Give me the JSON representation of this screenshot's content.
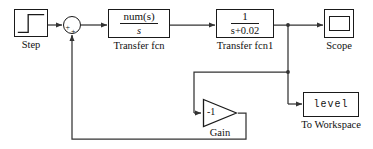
{
  "diagram": {
    "background_color": "#ffffff",
    "line_color": "#333333"
  },
  "blocks": {
    "step": {
      "label": "Step",
      "icon": "step-waveform-icon",
      "type": "source"
    },
    "sum": {
      "label": "",
      "icon": "summing-junction-icon",
      "type": "sum",
      "input_sign": "+",
      "feedback_sign": "+"
    },
    "transfer_fcn": {
      "label": "Transfer fcn",
      "numerator": "num(s)",
      "denominator": "s",
      "type": "transfer-function"
    },
    "transfer_fcn1": {
      "label": "Transfer fcn1",
      "numerator": "1",
      "denominator": "s+0.02",
      "type": "transfer-function"
    },
    "scope": {
      "label": "Scope",
      "icon": "scope-screen-icon",
      "type": "sink"
    },
    "gain": {
      "label": "Gain",
      "value": "-1",
      "icon": "gain-triangle-icon",
      "type": "gain"
    },
    "to_workspace": {
      "label": "To Workspace",
      "variable": "level",
      "type": "sink"
    }
  }
}
